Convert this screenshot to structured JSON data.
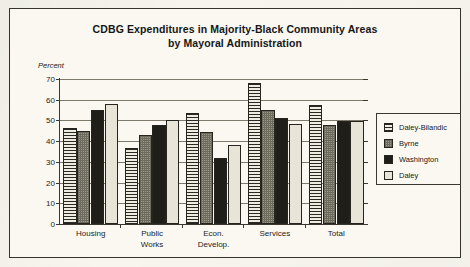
{
  "figure": {
    "title_line1": "CDBG Expenditures in Majority-Black Community Areas",
    "title_line2": "by Mayoral Administration",
    "y_axis_label": "Percent"
  },
  "legend": {
    "items": [
      {
        "label": "Daley-Bilandic",
        "pattern": "horizontal-lines"
      },
      {
        "label": "Byrne",
        "pattern": "stipple"
      },
      {
        "label": "Washington",
        "pattern": "solid-black"
      },
      {
        "label": "Daley",
        "pattern": "empty"
      }
    ]
  },
  "chart_data": {
    "type": "bar",
    "title": "CDBG Expenditures in Majority-Black Community Areas by Mayoral Administration",
    "xlabel": "",
    "ylabel": "Percent",
    "ylim": [
      0,
      70
    ],
    "yticks": [
      0,
      10,
      20,
      30,
      40,
      50,
      60,
      70
    ],
    "ytick_labels": [
      "0",
      "10",
      "20",
      "30",
      "40",
      "50",
      "60",
      "70"
    ],
    "grid": true,
    "legend_position": "right",
    "categories": [
      "Housing",
      "Public Works",
      "Econ. Develop.",
      "Services",
      "Total"
    ],
    "category_labels": [
      [
        "Housing"
      ],
      [
        "Public",
        "Works"
      ],
      [
        "Econ.",
        "Develop."
      ],
      [
        "Services"
      ],
      [
        "Total"
      ]
    ],
    "series": [
      {
        "name": "Daley-Bilandic",
        "values": [
          46.5,
          36.5,
          53.5,
          68.0,
          57.5
        ]
      },
      {
        "name": "Byrne",
        "values": [
          45.0,
          43.0,
          44.5,
          55.0,
          48.0
        ]
      },
      {
        "name": "Washington",
        "values": [
          55.0,
          48.0,
          32.0,
          51.0,
          49.5
        ]
      },
      {
        "name": "Daley",
        "values": [
          58.0,
          50.0,
          38.0,
          48.5,
          49.5
        ]
      }
    ]
  }
}
